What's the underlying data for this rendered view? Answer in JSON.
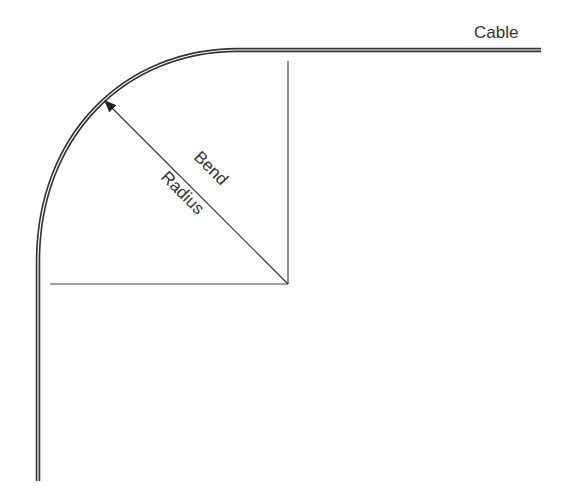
{
  "diagram": {
    "labels": {
      "cable": "Cable",
      "bend": "Bend",
      "radius": "Radius"
    },
    "colors": {
      "line": "#333333",
      "cable_inner": "#ffffff"
    }
  }
}
